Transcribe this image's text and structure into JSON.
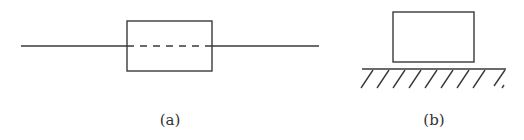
{
  "figures": [
    {
      "id": "a",
      "caption": "(a)",
      "description": "Rectangle with a horizontal line passing through it; the segment inside the rectangle is dashed"
    },
    {
      "id": "b",
      "caption": "(b)",
      "description": "Rectangle resting on a hatched ground surface"
    }
  ],
  "colors": {
    "stroke": "#3a3a3a",
    "background": "#ffffff",
    "text": "#333333"
  }
}
